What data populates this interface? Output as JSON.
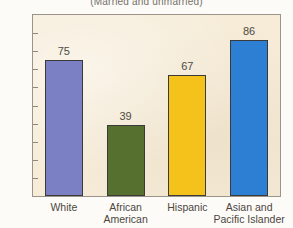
{
  "chart_data": {
    "type": "bar",
    "title": "(Married and unmarried)",
    "xlabel": "",
    "ylabel": "",
    "ylim": [
      0,
      100
    ],
    "ytick_step": 10,
    "grid": false,
    "legend": "none",
    "categories": [
      "White",
      "African American",
      "Hispanic",
      "Asian and Pacific Islander"
    ],
    "category_lines": [
      [
        "White"
      ],
      [
        "African",
        "American"
      ],
      [
        "Hispanic"
      ],
      [
        "Asian and",
        "Pacific Islander"
      ]
    ],
    "values": [
      75,
      39,
      67,
      86
    ],
    "value_labels": [
      "75",
      "39",
      "67",
      "86"
    ],
    "bar_colors": [
      "#7b7fc4",
      "#56702f",
      "#f5c21c",
      "#2c7fd2"
    ],
    "ytick_labels": [
      "100",
      "90",
      "80",
      "70",
      "60",
      "50",
      "40",
      "30",
      "20",
      "10",
      "0"
    ],
    "plot_background": "#f6ecd8",
    "page_background": "#fdfbf7",
    "axis_color": "#9a948b",
    "bar_outline_color": "#3a3a38"
  }
}
